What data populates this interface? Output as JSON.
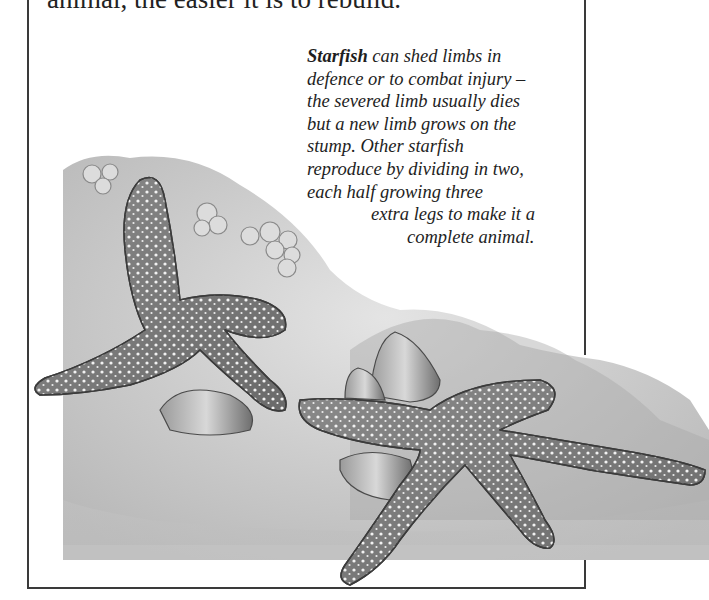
{
  "page": {
    "body_text_fragment": "animal, the easier it is to rebuild.",
    "caption": {
      "lead_bold": "Starfish",
      "lines": [
        " can shed limbs in",
        "defence or to combat injury –",
        "the severed limb usually dies",
        "but a new limb grows on the",
        "stump. Other starfish",
        "reproduce by dividing in two,",
        "each half growing three",
        "extra legs to make it a",
        "complete animal."
      ]
    },
    "illustration": {
      "subject": "Starfish on rocks with barnacles and mussels",
      "style": "grayscale pencil illustration"
    }
  }
}
